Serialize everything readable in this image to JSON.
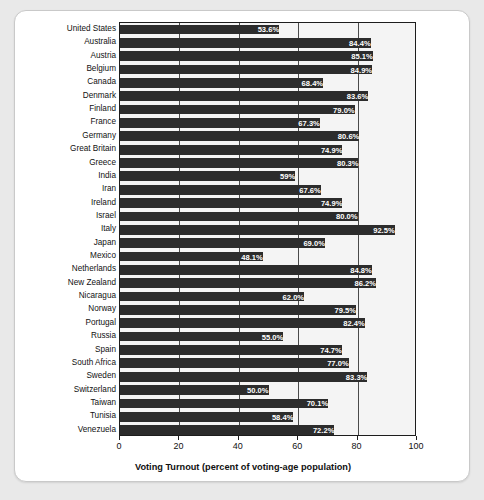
{
  "chart_data": {
    "type": "bar",
    "orientation": "horizontal",
    "title": "",
    "xlabel": "Voting Turnout (percent of voting-age population)",
    "ylabel": "",
    "xlim": [
      0,
      100
    ],
    "xticks": [
      "0",
      "20",
      "40",
      "60",
      "80",
      "100"
    ],
    "xtick_values": [
      0,
      20,
      40,
      60,
      80,
      100
    ],
    "grid": true,
    "legend": false,
    "bar_color": "#2c2c2c",
    "plot_background": "#f4f4f4",
    "label_color": "#ffffff",
    "categories": [
      "United States",
      "Australia",
      "Austria",
      "Belgium",
      "Canada",
      "Denmark",
      "Finland",
      "France",
      "Germany",
      "Great Britain",
      "Greece",
      "India",
      "Iran",
      "Ireland",
      "Israel",
      "Italy",
      "Japan",
      "Mexico",
      "Netherlands",
      "New Zealand",
      "Nicaragua",
      "Norway",
      "Portugal",
      "Russia",
      "Spain",
      "South Africa",
      "Sweden",
      "Switzerland",
      "Taiwan",
      "Tunisia",
      "Venezuela"
    ],
    "values": [
      53.6,
      84.4,
      85.1,
      84.9,
      68.4,
      83.6,
      79.0,
      67.3,
      80.6,
      74.9,
      80.3,
      59.0,
      67.6,
      74.9,
      80.0,
      92.5,
      69.0,
      48.1,
      84.8,
      86.2,
      62.0,
      79.5,
      82.4,
      55.0,
      74.7,
      77.0,
      83.3,
      50.0,
      70.1,
      58.4,
      72.2
    ],
    "data_labels": [
      "53.6%",
      "84.4%",
      "85.1%",
      "84.9%",
      "68.4%",
      "83.6%",
      "79.0%",
      "67.3%",
      "80.6%",
      "74.9%",
      "80.3%",
      "59%",
      "67.6%",
      "74.9%",
      "80.0%",
      "92.5%",
      "69.0%",
      "48.1%",
      "84.8%",
      "86.2%",
      "62.0%",
      "79.5%",
      "82.4%",
      "55.0%",
      "74.7%",
      "77.0%",
      "83.3%",
      "50.0%",
      "70.1%",
      "58.4%",
      "72.2%"
    ]
  }
}
